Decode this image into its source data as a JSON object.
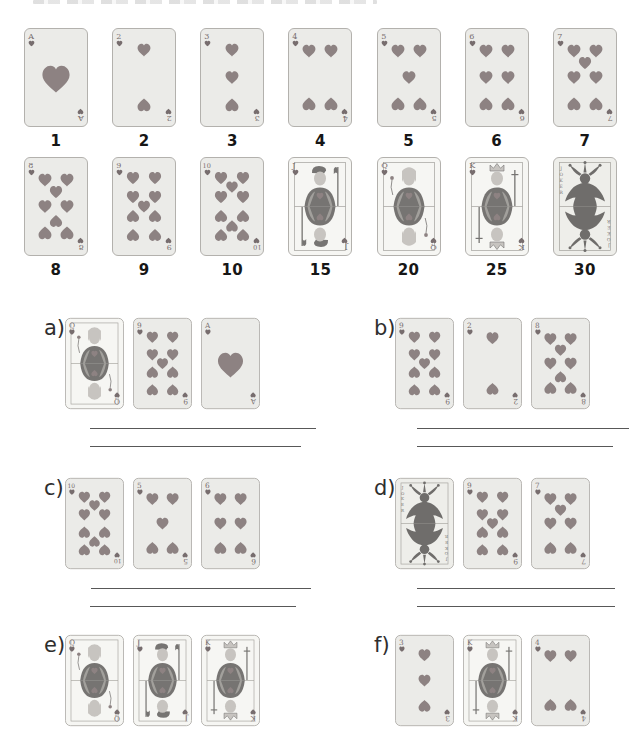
{
  "suit": "hearts",
  "colors": {
    "page_bg": "#ffffff",
    "card_bg": "#ebebe8",
    "face_card_bg": "#f6f6f3",
    "joker_card_bg": "#eeeeea",
    "card_border": "#b3b1ad",
    "inner_border": "#a3a19c",
    "pip": "#8d8282",
    "index": "#776d6e",
    "face_dark": "#767472",
    "face_light": "#c7c4c0",
    "joker": "#6f6d6b",
    "points_text": "#161616",
    "label_text": "#2e2e2e",
    "line": "#585858"
  },
  "legend": {
    "row1": [
      {
        "rank": "A",
        "value": "1"
      },
      {
        "rank": "2",
        "value": "2"
      },
      {
        "rank": "3",
        "value": "3"
      },
      {
        "rank": "4",
        "value": "4"
      },
      {
        "rank": "5",
        "value": "5"
      },
      {
        "rank": "6",
        "value": "6"
      },
      {
        "rank": "7",
        "value": "7"
      }
    ],
    "row2": [
      {
        "rank": "8",
        "value": "8"
      },
      {
        "rank": "9",
        "value": "9"
      },
      {
        "rank": "10",
        "value": "10"
      },
      {
        "rank": "J",
        "value": "15"
      },
      {
        "rank": "Q",
        "value": "20"
      },
      {
        "rank": "K",
        "value": "25"
      },
      {
        "rank": "JOKER",
        "value": "30"
      }
    ]
  },
  "exercises": [
    {
      "id": "a",
      "label": "a)",
      "cards": [
        "Q",
        "9",
        "A"
      ],
      "answer_lines": 2
    },
    {
      "id": "b",
      "label": "b)",
      "cards": [
        "9",
        "2",
        "8"
      ],
      "answer_lines": 2
    },
    {
      "id": "c",
      "label": "c)",
      "cards": [
        "10",
        "5",
        "6"
      ],
      "answer_lines": 2
    },
    {
      "id": "d",
      "label": "d)",
      "cards": [
        "JOKER",
        "9",
        "7"
      ],
      "answer_lines": 2
    },
    {
      "id": "e",
      "label": "e)",
      "cards": [
        "Q",
        "J",
        "K"
      ],
      "answer_lines": 0
    },
    {
      "id": "f",
      "label": "f)",
      "cards": [
        "3",
        "K",
        "4"
      ],
      "answer_lines": 0
    }
  ]
}
